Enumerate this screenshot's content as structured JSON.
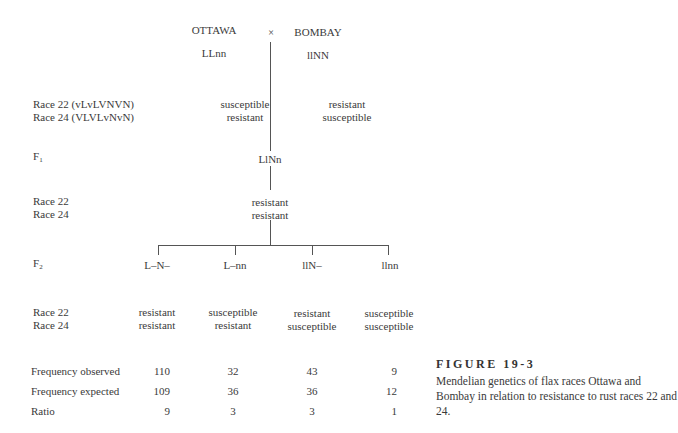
{
  "parents": {
    "left": {
      "name": "OTTAWA",
      "genotype": "LLnn",
      "race22": "susceptible",
      "race24": "resistant"
    },
    "cross_symbol": "×",
    "right": {
      "name": "BOMBAY",
      "genotype": "llNN",
      "race22": "resistant",
      "race24": "susceptible"
    }
  },
  "row_labels": {
    "parent_race22": "Race 22 (vLvLVNVN)",
    "parent_race24": "Race 24 (VLVLvNvN)",
    "f1": "F",
    "f1_sub": "1",
    "f1_race22": "Race 22",
    "f1_race24": "Race 24",
    "f2": "F",
    "f2_sub": "2",
    "f2_race22": "Race 22",
    "f2_race24": "Race 24",
    "freq_observed": "Frequency observed",
    "freq_expected": "Frequency expected",
    "ratio": "Ratio"
  },
  "f1": {
    "genotype": "LlNn",
    "race22": "resistant",
    "race24": "resistant"
  },
  "f2": [
    {
      "genotype": "L–N–",
      "race22": "resistant",
      "race24": "resistant",
      "observed": "110",
      "expected": "109",
      "ratio": "9"
    },
    {
      "genotype": "L–nn",
      "race22": "susceptible",
      "race24": "resistant",
      "observed": "32",
      "expected": "36",
      "ratio": "3"
    },
    {
      "genotype": "llN–",
      "race22": "resistant",
      "race24": "susceptible",
      "observed": "43",
      "expected": "36",
      "ratio": "3"
    },
    {
      "genotype": "llnn",
      "race22": "susceptible",
      "race24": "susceptible",
      "observed": "9",
      "expected": "12",
      "ratio": "1"
    }
  ],
  "caption": {
    "title": "FIGURE 19-3",
    "text": "Mendelian genetics of flax races Ottawa and Bombay in relation to resistance to rust races 22 and 24."
  }
}
